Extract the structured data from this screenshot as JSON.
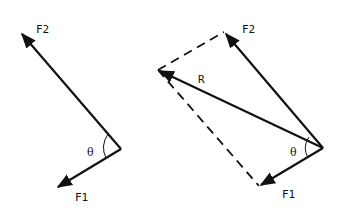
{
  "diagram": {
    "type": "vector-addition-parallelogram",
    "colors": {
      "stroke": "#111111",
      "background": "#ffffff"
    },
    "left": {
      "title": "Two force vectors at angle",
      "labels": {
        "f2": "F2",
        "f1": "F1",
        "angle": "θ"
      },
      "origin": [
        121,
        149
      ],
      "f2_tip": [
        20,
        32
      ],
      "f1_tip": [
        56,
        188
      ]
    },
    "right": {
      "title": "Parallelogram with resultant",
      "labels": {
        "f2": "F2",
        "f1": "F1",
        "r": "R",
        "angle": "θ"
      },
      "origin": [
        323,
        148
      ],
      "f2_tip": [
        224,
        32
      ],
      "f1_tip": [
        259,
        186
      ],
      "r_tip": [
        158,
        70
      ]
    }
  }
}
